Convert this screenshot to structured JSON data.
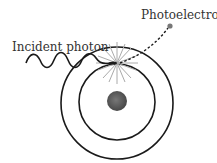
{
  "diagram": {
    "labels": {
      "incident_photon": "Incident photon",
      "photoelectron": "Photoelectron"
    },
    "colors": {
      "line": "#1a1a1a",
      "nucleus": "#555555",
      "burst": "#aaaaaa",
      "electron": "#777777"
    }
  }
}
